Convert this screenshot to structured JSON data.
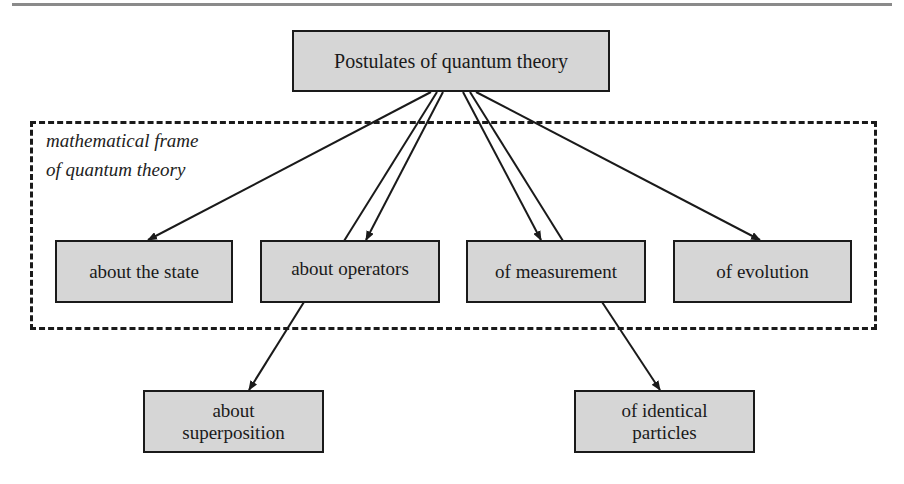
{
  "diagram": {
    "root": {
      "label": "Postulates of quantum theory"
    },
    "frame": {
      "label": "mathematical frame\nof quantum theory"
    },
    "level1": [
      {
        "id": "state",
        "label": "about the state"
      },
      {
        "id": "operators",
        "label": "about operators"
      },
      {
        "id": "measurement",
        "label": "of measurement"
      },
      {
        "id": "evolution",
        "label": "of evolution"
      }
    ],
    "level2": [
      {
        "id": "superposition",
        "label": "about\nsuperposition"
      },
      {
        "id": "identical",
        "label": "of identical\nparticles"
      }
    ],
    "edges": [
      {
        "from": "root",
        "to": "about the state"
      },
      {
        "from": "root",
        "to": "about operators"
      },
      {
        "from": "about operators",
        "to": "root"
      },
      {
        "from": "root",
        "to": "of measurement"
      },
      {
        "from": "of measurement",
        "to": "root"
      },
      {
        "from": "root",
        "to": "of evolution"
      },
      {
        "from": "about operators",
        "to": "about superposition"
      },
      {
        "from": "of measurement",
        "to": "of identical particles"
      }
    ]
  }
}
